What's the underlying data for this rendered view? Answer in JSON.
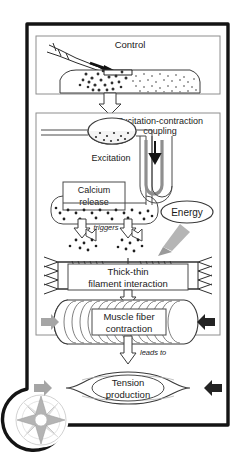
{
  "figure": {
    "panels": [
      {
        "id": "control",
        "title": "Control"
      },
      {
        "id": "ec-coupling",
        "title": "Excitation-contraction coupling"
      }
    ],
    "labels": {
      "control": "Control",
      "ec_coupling_line1": "Excitation-contraction",
      "ec_coupling_line2": "coupling",
      "excitation": "Excitation",
      "calcium_line1": "Calcium",
      "calcium_line2": "release",
      "triggers": "triggers",
      "energy": "Energy",
      "filament_line1": "Thick-thin",
      "filament_line2": "filament interaction",
      "muscle_line1": "Muscle fiber",
      "muscle_line2": "contraction",
      "leads_to": "leads to",
      "tension_line1": "Tension",
      "tension_line2": "production"
    },
    "icons": {
      "compass_rose": "compass-rose-icon",
      "down_arrow": "hollow-down-arrow-icon",
      "excitation_arrow": "black-down-arrow-icon",
      "energy_arrow": "gray-arrow-icon",
      "load_arrow_left": "gray-right-arrow-icon",
      "load_arrow_right": "black-left-arrow-icon"
    },
    "colors": {
      "frame": "#141414",
      "panel_border": "#8e8e8e",
      "text": "#1a1a1a",
      "gray_arrow": "#9a9a9a",
      "black_arrow": "#242424",
      "compass": "#b8b8b8",
      "fill_light": "#f2f2f2",
      "tubule_shade": "#8f8f8f",
      "background": "#ffffff"
    }
  }
}
